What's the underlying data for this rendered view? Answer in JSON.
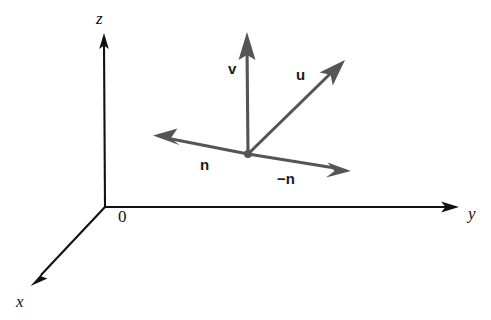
{
  "figure": {
    "kind": "vector-diagram",
    "width": 491,
    "height": 320,
    "background_color": "#ffffff"
  },
  "colors": {
    "axis": "#111111",
    "vector": "#555555",
    "label": "#1a1a1a",
    "background": "#ffffff"
  },
  "axes": {
    "origin": {
      "x": 105,
      "y": 207,
      "label": "0",
      "label_x": 118,
      "label_y": 222
    },
    "items": [
      {
        "name": "z-axis",
        "label": "z",
        "label_x": 96,
        "label_y": 24,
        "from_x": 105,
        "from_y": 207,
        "to_x": 104,
        "to_y": 35
      },
      {
        "name": "y-axis",
        "label": "y",
        "label_x": 468,
        "label_y": 219,
        "from_x": 105,
        "from_y": 207,
        "to_x": 458,
        "to_y": 207
      },
      {
        "name": "x-axis",
        "label": "x",
        "label_x": 16,
        "label_y": 307,
        "from_x": 105,
        "from_y": 207,
        "to_x": 31,
        "to_y": 286
      }
    ]
  },
  "vectors": {
    "base_point": {
      "x": 248,
      "y": 154,
      "name": "vector-base-point"
    },
    "items": [
      {
        "name": "vector-v",
        "label": "v",
        "label_x": 228,
        "label_y": 74,
        "from_x": 248,
        "from_y": 154,
        "to_x": 247,
        "to_y": 32
      },
      {
        "name": "vector-u",
        "label": "u",
        "label_x": 296,
        "label_y": 80,
        "from_x": 248,
        "from_y": 154,
        "to_x": 344,
        "to_y": 61
      },
      {
        "name": "vector-n",
        "label": "n",
        "label_x": 200,
        "label_y": 170,
        "from_x": 248,
        "from_y": 154,
        "to_x": 154,
        "to_y": 136
      },
      {
        "name": "vector-neg-n",
        "label": "−n",
        "label_x": 277,
        "label_y": 184,
        "from_x": 248,
        "from_y": 154,
        "to_x": 350,
        "to_y": 171
      }
    ]
  }
}
